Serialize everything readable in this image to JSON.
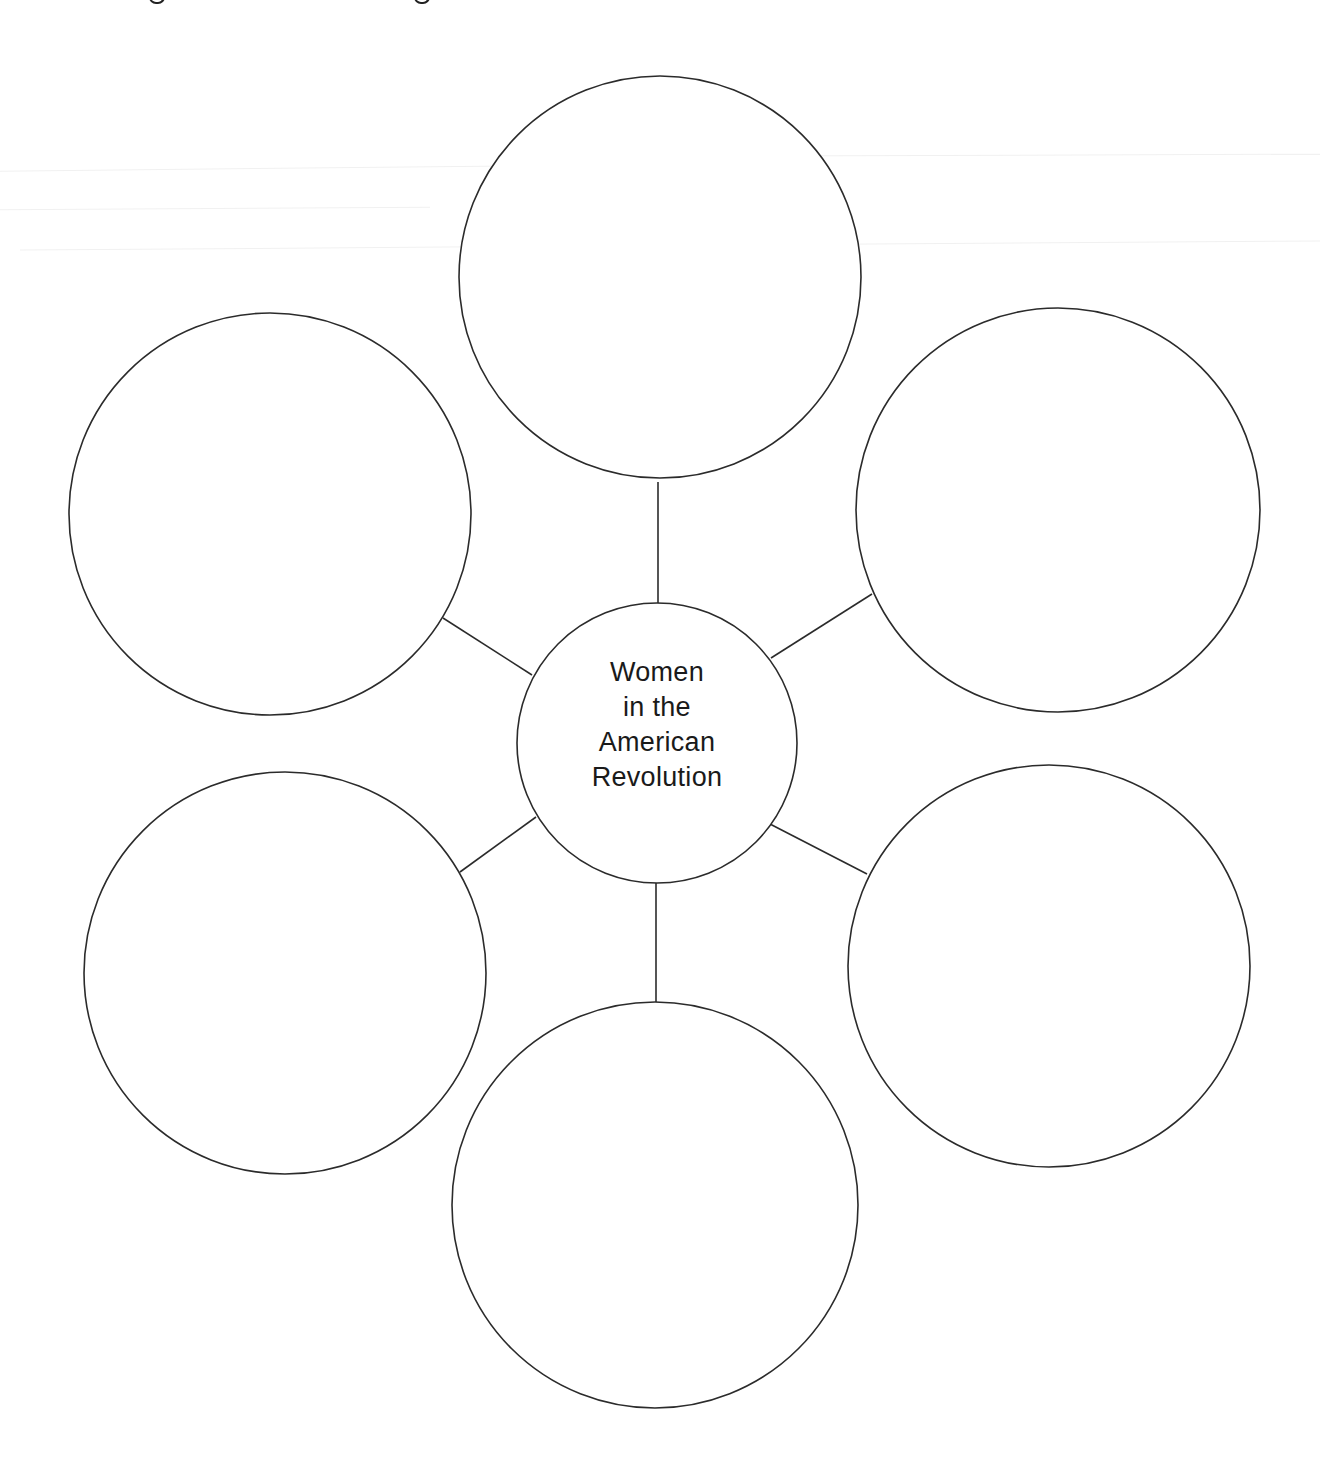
{
  "diagram": {
    "type": "concept-web",
    "center": {
      "label_lines": [
        "Women",
        "in the",
        "American",
        "Revolution"
      ],
      "cx": 657,
      "cy": 743,
      "r": 140
    },
    "satellites": [
      {
        "id": "top",
        "label": "",
        "cx": 660,
        "cy": 277,
        "r": 201
      },
      {
        "id": "upper-right",
        "label": "",
        "cx": 1058,
        "cy": 510,
        "r": 202
      },
      {
        "id": "lower-right",
        "label": "",
        "cx": 1049,
        "cy": 966,
        "r": 201
      },
      {
        "id": "bottom",
        "label": "",
        "cx": 655,
        "cy": 1205,
        "r": 203
      },
      {
        "id": "lower-left",
        "label": "",
        "cx": 285,
        "cy": 973,
        "r": 201
      },
      {
        "id": "upper-left",
        "label": "",
        "cx": 270,
        "cy": 514,
        "r": 201
      }
    ],
    "connectors": [
      {
        "to": "top",
        "x1": 658,
        "y1": 482,
        "x2": 658,
        "y2": 603
      },
      {
        "to": "upper-right",
        "x1": 872,
        "y1": 594,
        "x2": 771,
        "y2": 658
      },
      {
        "to": "lower-right",
        "x1": 867,
        "y1": 874,
        "x2": 770,
        "y2": 824
      },
      {
        "to": "bottom",
        "x1": 656,
        "y1": 1002,
        "x2": 656,
        "y2": 883
      },
      {
        "to": "lower-left",
        "x1": 460,
        "y1": 872,
        "x2": 536,
        "y2": 817
      },
      {
        "to": "upper-left",
        "x1": 443,
        "y1": 618,
        "x2": 532,
        "y2": 675
      }
    ],
    "stroke_color": "#2b2b2b",
    "background": "#ffffff"
  }
}
